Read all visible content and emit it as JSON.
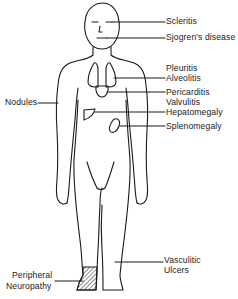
{
  "diagram": {
    "type": "anatomical-figure",
    "figure": "human body, front view",
    "line_color": "#1a1a1a",
    "background": "#ffffff",
    "labels": {
      "scleritis": "Scleritis",
      "sjogrens": "Sjogren's disease",
      "pleuritis": "Pleuritis",
      "alveolitis": "Alveolitis",
      "pericarditis": "Pericarditis",
      "valvulitis": "Valvulitis",
      "hepatomegaly": "Hepatomegaly",
      "splenomegaly": "Splenomegaly",
      "nodules": "Nodules",
      "vasculitic_1": "Vasculitic",
      "vasculitic_2": "Ulcers",
      "peripheral_1": "Peripheral",
      "peripheral_2": "Neuropathy"
    },
    "callouts": [
      {
        "label": "Scleritis",
        "target": "eyes"
      },
      {
        "label": "Sjogren's disease",
        "target": "mouth"
      },
      {
        "label": "Pleuritis / Alveolitis",
        "target": "lungs"
      },
      {
        "label": "Pericarditis / Valvulitis",
        "target": "heart"
      },
      {
        "label": "Hepatomegaly",
        "target": "liver"
      },
      {
        "label": "Splenomegaly",
        "target": "spleen"
      },
      {
        "label": "Nodules",
        "target": "right arm"
      },
      {
        "label": "Vasculitic Ulcers",
        "target": "left lower leg"
      },
      {
        "label": "Peripheral Neuropathy",
        "target": "right foot (hatched)"
      }
    ]
  }
}
